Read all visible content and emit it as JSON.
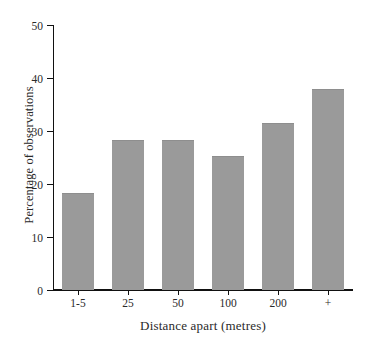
{
  "chart_data": {
    "type": "bar",
    "title": "",
    "subtitle": "",
    "xlabel": "Distance apart (metres)",
    "ylabel": "Percentage of observations",
    "categories": [
      "1-5",
      "25",
      "50",
      "100",
      "200",
      "+"
    ],
    "values": [
      18.1,
      28.1,
      28.1,
      25.1,
      31.3,
      37.7
    ],
    "series": [
      {
        "name": "Percentage of observations",
        "values": [
          18.1,
          28.1,
          28.1,
          25.1,
          31.3,
          37.7
        ]
      }
    ],
    "ylim": [
      0,
      50
    ],
    "ytick_labels": [
      "0",
      "10",
      "20",
      "30",
      "40",
      "50"
    ],
    "ytick_values": [
      0,
      10,
      20,
      30,
      40,
      50
    ],
    "grid": false,
    "legend": false,
    "legend_position": "none",
    "bar_color": "#9a9a9a",
    "axis_color": "#111111",
    "background_color": "#ffffff",
    "annotations": []
  }
}
